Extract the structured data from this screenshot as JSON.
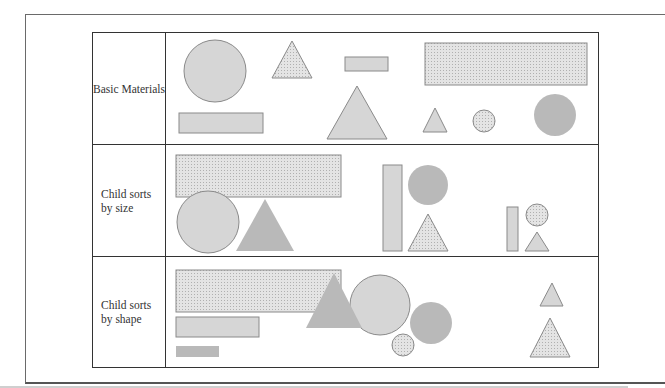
{
  "diagram": {
    "rows": [
      {
        "label_lines": [
          "Basic Materials"
        ],
        "shapes": [
          {
            "type": "circle",
            "fill": "light",
            "size": "large"
          },
          {
            "type": "triangle",
            "fill": "dotted",
            "size": "medium"
          },
          {
            "type": "rectangle",
            "fill": "light",
            "size": "small"
          },
          {
            "type": "rectangle",
            "fill": "dotted",
            "size": "large"
          },
          {
            "type": "rectangle",
            "fill": "light",
            "size": "medium"
          },
          {
            "type": "triangle",
            "fill": "light",
            "size": "large"
          },
          {
            "type": "triangle",
            "fill": "light",
            "size": "small"
          },
          {
            "type": "circle",
            "fill": "dotted",
            "size": "small"
          },
          {
            "type": "circle",
            "fill": "dark",
            "size": "medium"
          }
        ]
      },
      {
        "label_lines": [
          "Child sorts",
          "by size"
        ],
        "shapes": [
          {
            "type": "rectangle",
            "fill": "dotted",
            "size": "large",
            "group": "large"
          },
          {
            "type": "circle",
            "fill": "light",
            "size": "large",
            "group": "large"
          },
          {
            "type": "triangle",
            "fill": "dark",
            "size": "large",
            "group": "large"
          },
          {
            "type": "rectangle",
            "fill": "light",
            "size": "medium",
            "group": "medium"
          },
          {
            "type": "circle",
            "fill": "dark",
            "size": "medium",
            "group": "medium"
          },
          {
            "type": "triangle",
            "fill": "dotted",
            "size": "medium",
            "group": "medium"
          },
          {
            "type": "rectangle",
            "fill": "light",
            "size": "small",
            "group": "small"
          },
          {
            "type": "circle",
            "fill": "dotted",
            "size": "small",
            "group": "small"
          },
          {
            "type": "triangle",
            "fill": "light",
            "size": "small",
            "group": "small"
          }
        ]
      },
      {
        "label_lines": [
          "Child sorts",
          "by shape"
        ],
        "shapes": [
          {
            "type": "rectangle",
            "fill": "dotted",
            "size": "large",
            "group": "rectangles"
          },
          {
            "type": "rectangle",
            "fill": "light",
            "size": "medium",
            "group": "rectangles"
          },
          {
            "type": "rectangle",
            "fill": "dark",
            "size": "small",
            "group": "rectangles"
          },
          {
            "type": "circle",
            "fill": "light",
            "size": "large",
            "group": "circles"
          },
          {
            "type": "circle",
            "fill": "dark",
            "size": "medium",
            "group": "circles"
          },
          {
            "type": "circle",
            "fill": "dotted",
            "size": "small",
            "group": "circles"
          },
          {
            "type": "triangle",
            "fill": "dark",
            "size": "large",
            "group": "triangles"
          },
          {
            "type": "triangle",
            "fill": "light",
            "size": "small",
            "group": "triangles"
          },
          {
            "type": "triangle",
            "fill": "dotted",
            "size": "medium",
            "group": "triangles"
          }
        ]
      }
    ],
    "fills": {
      "light": "#d6d6d6",
      "dark": "#b9b9b9",
      "dotted": "#e4e4e4",
      "stroke": "#8a8a8a"
    }
  }
}
